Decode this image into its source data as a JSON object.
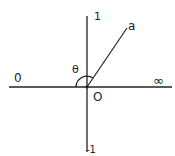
{
  "diagram": {
    "labels": {
      "top": "1",
      "bottom": "-1",
      "left": "0",
      "right": "∞",
      "origin": "O",
      "ray": "a",
      "angle": "θ"
    },
    "colors": {
      "stroke": "#222222",
      "background": "#ffffff"
    }
  }
}
